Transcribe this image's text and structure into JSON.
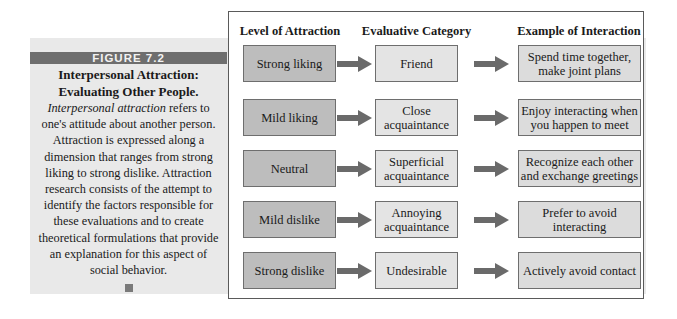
{
  "figure": {
    "label": "FIGURE 7.2",
    "title": "Interpersonal Attraction: Evaluating Other People.",
    "body_italic": "Interpersonal attraction",
    "body_rest": " refers to one's attitude about another person. Attraction is expressed along a dimension that ranges from strong liking to strong dislike. Attraction research consists of the attempt to identify the factors responsible for these evaluations and to create theoretical formulations that provide an explanation for this aspect of social behavior."
  },
  "diagram": {
    "headers": [
      "Level of Attraction",
      "Evaluative Category",
      "Example of Interaction"
    ],
    "rows": [
      {
        "level": "Strong liking",
        "category": "Friend",
        "example": "Spend time together, make joint plans"
      },
      {
        "level": "Mild liking",
        "category": "Close acquaintance",
        "example": "Enjoy interacting when you happen to meet"
      },
      {
        "level": "Neutral",
        "category": "Superficial acquaintance",
        "example": "Recognize each other and exchange greetings"
      },
      {
        "level": "Mild dislike",
        "category": "Annoying acquaintance",
        "example": "Prefer to avoid interacting"
      },
      {
        "level": "Strong dislike",
        "category": "Undesirable",
        "example": "Actively avoid contact"
      }
    ],
    "colors": {
      "level_fill": "#bdbdbd",
      "category_fill": "#e4e4e4",
      "example_fill": "#dcdcdc",
      "arrow": "#6a6a6a"
    }
  }
}
